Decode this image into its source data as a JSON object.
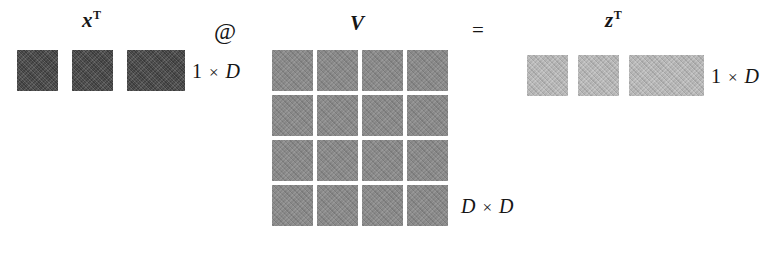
{
  "diagram": {
    "operands": {
      "x": {
        "symbol": "x",
        "superscript": "T",
        "shape_label": "1 × D",
        "shape_rows": 1,
        "shape_cols": 4,
        "color": "#4a4a4a",
        "cells": [
          [
            1,
            1,
            1,
            1
          ]
        ]
      },
      "v": {
        "symbol": "V",
        "superscript": "",
        "shape_label": "D × D",
        "shape_rows": 4,
        "shape_cols": 4,
        "color": "#8a8a8a",
        "cells": [
          [
            1,
            1,
            1,
            1
          ],
          [
            1,
            1,
            1,
            1
          ],
          [
            1,
            1,
            1,
            1
          ],
          [
            1,
            1,
            1,
            1
          ]
        ]
      },
      "z": {
        "symbol": "z",
        "superscript": "T",
        "shape_label": "1 × D",
        "shape_rows": 1,
        "shape_cols": 4,
        "color": "#b4b4b4",
        "cells": [
          [
            1,
            1,
            1,
            1
          ]
        ]
      }
    },
    "operators": {
      "matmul": "@",
      "equals": "="
    },
    "dim_parts": {
      "one": "1",
      "times": "×",
      "d": "D"
    },
    "background": "#ffffff",
    "ink": "#161616"
  }
}
